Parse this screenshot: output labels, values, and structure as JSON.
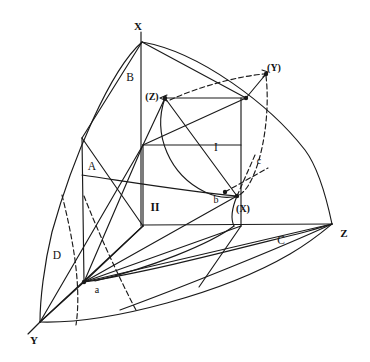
{
  "figure": {
    "background_color": "#ffffff",
    "stroke_color": "#1a1a1a",
    "width": 370,
    "height": 362
  },
  "axis_labels": [
    {
      "name": "axis-label-x",
      "text": "X",
      "x": 138,
      "y": 26,
      "bold": true
    },
    {
      "name": "axis-label-y",
      "text": "Y",
      "x": 34,
      "y": 340,
      "bold": true
    },
    {
      "name": "axis-label-z",
      "text": "Z",
      "x": 344,
      "y": 233,
      "bold": true
    }
  ],
  "vertex_labels": [
    {
      "name": "vertex-label-x-paren",
      "text": "(X)",
      "x": 243,
      "y": 209,
      "bold": true
    },
    {
      "name": "vertex-label-y-paren",
      "text": "(Y)",
      "x": 274,
      "y": 68,
      "bold": true
    },
    {
      "name": "vertex-label-z-paren",
      "text": "(Z)",
      "x": 152,
      "y": 97,
      "bold": true
    }
  ],
  "point_labels": [
    {
      "name": "point-label-a",
      "text": "a",
      "x": 97,
      "y": 290,
      "bold": false
    },
    {
      "name": "point-label-b",
      "text": "b",
      "x": 216,
      "y": 200,
      "bold": false
    },
    {
      "name": "point-label-c",
      "text": "c",
      "x": 259,
      "y": 161,
      "bold": false
    }
  ],
  "region_labels": [
    {
      "name": "region-label-a",
      "text": "A",
      "x": 92,
      "y": 167
    },
    {
      "name": "region-label-b",
      "text": "B",
      "x": 130,
      "y": 78
    },
    {
      "name": "region-label-c",
      "text": "C",
      "x": 281,
      "y": 241
    },
    {
      "name": "region-label-d",
      "text": "D",
      "x": 57,
      "y": 256
    },
    {
      "name": "region-label-one",
      "text": "I",
      "x": 216,
      "y": 148
    },
    {
      "name": "region-label-two",
      "text": "II",
      "x": 155,
      "y": 208
    }
  ],
  "geometry": {
    "octant_vertices": {
      "X": [
        142,
        42
      ],
      "Y": [
        40,
        322
      ],
      "Z": [
        332,
        224
      ]
    },
    "cube_vertices": {
      "origin": [
        143,
        226
      ],
      "front_bottom_right": [
        241,
        226
      ],
      "front_top_left": [
        143,
        145
      ],
      "front_top_right": [
        241,
        145
      ],
      "back_bottom_left": [
        84,
        282
      ],
      "back_top_left": [
        165,
        98
      ],
      "back_top_right": [
        246,
        98
      ]
    },
    "inscribed_points": {
      "a": [
        84,
        282
      ],
      "b": [
        225,
        192
      ],
      "c": [
        255,
        155
      ],
      "X_paren": [
        237,
        196
      ],
      "Y_paren": [
        266,
        74
      ],
      "Z_paren": [
        165,
        98
      ]
    }
  }
}
